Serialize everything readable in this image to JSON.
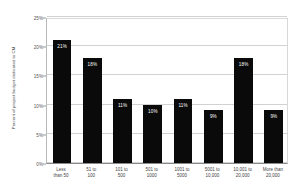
{
  "chart_data": {
    "type": "bar",
    "title": "",
    "xlabel": "",
    "ylabel": "Percent of project budget dedicated to CM",
    "ylim": [
      0,
      25
    ],
    "ytick_labels": [
      "25%",
      "20%",
      "15%",
      "10%",
      "5%",
      "0%"
    ],
    "ytick_values": [
      25,
      20,
      15,
      10,
      5,
      0
    ],
    "grid": true,
    "legend": "none",
    "bar_color": "#0a0a0a",
    "label_color": "#ffffff",
    "gridline_color": "#d2d2d2",
    "categories": [
      {
        "line1": "Less",
        "line2": "than 50"
      },
      {
        "line1": "51 to",
        "line2": "100"
      },
      {
        "line1": "101 to",
        "line2": "500"
      },
      {
        "line1": "501 to",
        "line2": "1000"
      },
      {
        "line1": "1001 to",
        "line2": "5000"
      },
      {
        "line1": "5001 to",
        "line2": "10,000"
      },
      {
        "line1": "10,001 to",
        "line2": "20,000"
      },
      {
        "line1": "More than",
        "line2": "20,000"
      }
    ],
    "values": [
      21,
      18,
      11,
      10,
      11,
      9,
      18,
      9
    ],
    "value_labels": [
      "21%",
      "18%",
      "11%",
      "10%",
      "11%",
      "9%",
      "18%",
      "9%"
    ]
  }
}
